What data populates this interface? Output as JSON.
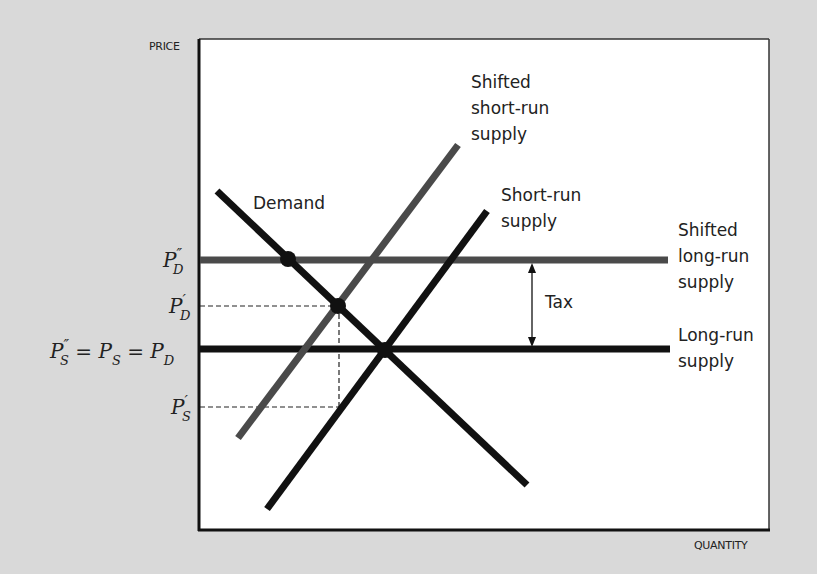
{
  "axes": {
    "y_title": "PRICE",
    "x_title": "QUANTITY"
  },
  "curves": {
    "demand": "Demand",
    "short_run_supply": [
      "Short-run",
      "supply"
    ],
    "shifted_short_run_supply": [
      "Shifted",
      "short-run",
      "supply"
    ],
    "long_run_supply": [
      "Long-run",
      "supply"
    ],
    "shifted_long_run_supply": [
      "Shifted",
      "long-run",
      "supply"
    ]
  },
  "annotations": {
    "tax": "Tax"
  },
  "price_levels": {
    "pd_double_prime": {
      "main": "P",
      "sup": "″",
      "sub": "D"
    },
    "pd_prime": {
      "main": "P",
      "sup": "′",
      "sub": "D"
    },
    "equilibrium": "P″S = PS = PD",
    "ps_prime": {
      "main": "P",
      "sup": "′",
      "sub": "S"
    }
  },
  "colors": {
    "background": "#d9d9d9",
    "plot_bg": "#ffffff",
    "black_line": "#111111",
    "shifted_line": "#4a4a4a"
  }
}
